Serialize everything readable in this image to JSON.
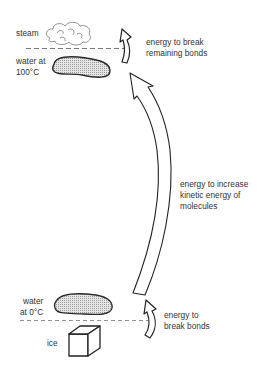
{
  "diagram": {
    "type": "energy-state-changes",
    "states": [
      {
        "id": "steam",
        "label": "steam"
      },
      {
        "id": "water-100",
        "label_line1": "water at",
        "label_line2": "100°C"
      },
      {
        "id": "water-0",
        "label_line1": "water",
        "label_line2": "at 0°C"
      },
      {
        "id": "ice",
        "label": "ice"
      }
    ],
    "arrows": [
      {
        "id": "vaporize",
        "label_line1": "energy to break",
        "label_line2": "remaining bonds"
      },
      {
        "id": "heat",
        "label_line1": "energy to increase",
        "label_line2": "kinetic energy of",
        "label_line3": "molecules"
      },
      {
        "id": "melt",
        "label_line1": "energy to",
        "label_line2": "break bonds"
      }
    ],
    "colors": {
      "stroke": "#2a2a2a",
      "water_fill": "#d4d4d4",
      "background": "#ffffff"
    }
  }
}
